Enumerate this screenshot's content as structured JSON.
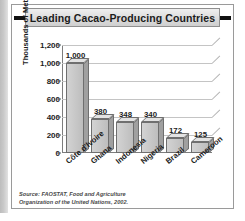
{
  "title": "Leading Cacao-Producing Countries",
  "source_note_line1": "Source: FAOSTAT, Food and Agriculture",
  "source_note_line2": "Organization of the United Nations, 2002.",
  "colors": {
    "bar_face": "#c6c6c6",
    "bar_side": "#a0a0a0",
    "bar_top": "#e3e3e3",
    "bar_outline": "#6f6f6f",
    "grid": "#c4c4c4",
    "title_band": "#dcdcdc",
    "text": "#1b1b1b"
  },
  "chart_data": {
    "type": "bar",
    "title": "Leading Cacao-Producing Countries",
    "xlabel": "",
    "ylabel": "Thousands of Metric Tons",
    "categories": [
      "Côte d'Ivoire",
      "Ghana",
      "Indonesia",
      "Nigeria",
      "Brazil",
      "Cameroon"
    ],
    "values": [
      1000,
      380,
      348,
      340,
      172,
      125
    ],
    "value_labels": [
      "1,000",
      "380",
      "348",
      "340",
      "172",
      "125"
    ],
    "ylim": [
      0,
      1200
    ],
    "ytick_values": [
      0,
      200,
      400,
      600,
      800,
      1000,
      1200
    ],
    "ytick_labels": [
      "0",
      "200",
      "400",
      "600",
      "800",
      "1,000",
      "1,200"
    ],
    "grid": true,
    "legend": false,
    "style": "3d-column"
  }
}
